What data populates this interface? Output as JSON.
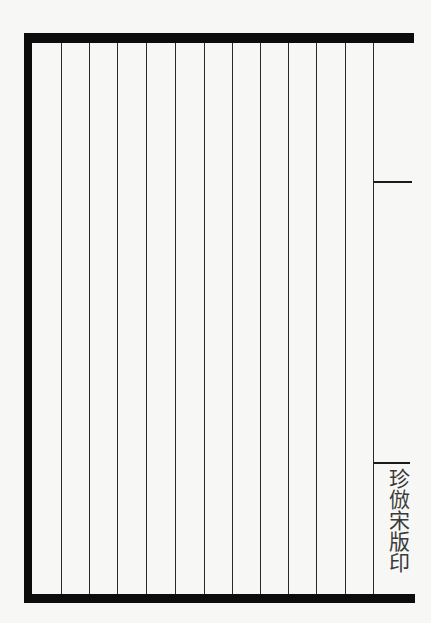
{
  "page": {
    "type": "blank ruled woodblock-print page (right half of folio)",
    "column_count": 12,
    "column_line_x": [
      61,
      89,
      117,
      146,
      175,
      204,
      232,
      260,
      288,
      316,
      345,
      373
    ],
    "frame": {
      "top_y": 33,
      "bottom_y": 603,
      "left_x": 24,
      "right_open": true,
      "color": "#0c0c0c"
    },
    "center_fold": {
      "upper_tick_y": 182,
      "lower_tick_y": 463,
      "text": "珍倣宋版印"
    },
    "colors": {
      "paper": "#f7f7f5",
      "ink": "#0c0c0c",
      "rule": "#2a2a2a"
    }
  }
}
